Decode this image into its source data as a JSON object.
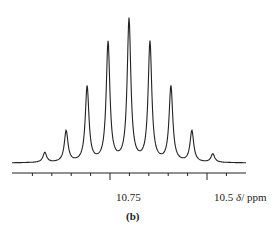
{
  "chart_data": {
    "type": "line",
    "title": "",
    "caption": "(b)",
    "xlabel": "δ/ppm",
    "ylabel": "",
    "x_reversed": true,
    "xlim": [
      10.96,
      10.41
    ],
    "x_major_ticks": [
      10.75,
      10.5
    ],
    "x_tick_labels": [
      "10.75",
      "10.5"
    ],
    "x_minor_tick_step": 0.05,
    "grid": false,
    "legend": null,
    "series": [
      {
        "name": "1H NMR multiplet (nonet)",
        "peaks": [
          {
            "ppm": 10.918,
            "rel_intensity": 0.07
          },
          {
            "ppm": 10.863,
            "rel_intensity": 0.22
          },
          {
            "ppm": 10.809,
            "rel_intensity": 0.53
          },
          {
            "ppm": 10.755,
            "rel_intensity": 0.84
          },
          {
            "ppm": 10.701,
            "rel_intensity": 1.0
          },
          {
            "ppm": 10.647,
            "rel_intensity": 0.84
          },
          {
            "ppm": 10.593,
            "rel_intensity": 0.53
          },
          {
            "ppm": 10.539,
            "rel_intensity": 0.22
          },
          {
            "ppm": 10.485,
            "rel_intensity": 0.06
          }
        ]
      }
    ]
  },
  "labels": {
    "tick_10_75": "10.75",
    "tick_10_5": "10.5",
    "unit_delta": "δ",
    "unit_ppm": "/ ppm",
    "caption": "(b)"
  }
}
